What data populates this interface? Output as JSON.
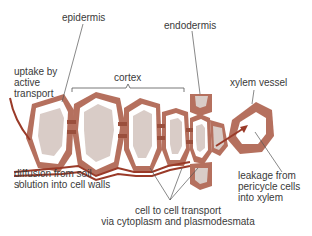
{
  "labels": {
    "epidermis": "epidermis",
    "endodermis": "endodermis",
    "uptake_line1": "uptake by",
    "uptake_line2": "active",
    "uptake_line3": "transport",
    "cortex": "cortex",
    "xylem_vessel": "xylem vessel",
    "diffusion_line1": "diffusion from soil",
    "diffusion_line2": "solution into cell walls",
    "leakage_line1": "leakage from",
    "leakage_line2": "pericycle cells",
    "leakage_line3": "into xylem",
    "cell_transport_line1": "cell to cell transport",
    "cell_transport_line2": "via cytoplasm and plasmodesmata"
  },
  "colors": {
    "cell_wall": "#b5705e",
    "cell_wall_dark": "#9a4f3c",
    "cytoplasm": "#ffffff",
    "vacuole": "#d9ccc7",
    "arrow": "#9a3a28",
    "leader": "#555555",
    "text": "#3a3a3a"
  }
}
